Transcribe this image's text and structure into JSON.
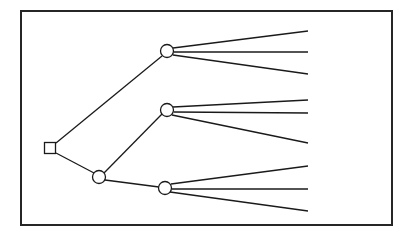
{
  "diagram": {
    "type": "decision-tree",
    "canvas": {
      "width": 412,
      "height": 238
    },
    "style": {
      "background_color": "#ffffff",
      "stroke_color": "#1a1a1a",
      "frame_stroke_color": "#262626",
      "node_fill_color": "#ffffff",
      "edge_stroke_width": 1.3,
      "frame_stroke_width": 2.0,
      "node_stroke_width": 1.3
    },
    "frame": {
      "x": 21,
      "y": 11,
      "width": 371,
      "height": 214
    },
    "nodes": [
      {
        "id": "root",
        "name": "root-decision-node",
        "shape": "square",
        "x": 50,
        "y": 148,
        "size": 11
      },
      {
        "id": "c-top",
        "name": "chance-node-top",
        "shape": "circle",
        "x": 167,
        "y": 51,
        "r": 6.5
      },
      {
        "id": "c-mid",
        "name": "chance-node-middle",
        "shape": "circle",
        "x": 167,
        "y": 110,
        "r": 6.5
      },
      {
        "id": "c-low",
        "name": "chance-node-lower-left",
        "shape": "circle",
        "x": 99,
        "y": 177,
        "r": 6.5
      },
      {
        "id": "c-bot",
        "name": "chance-node-bottom",
        "shape": "circle",
        "x": 165,
        "y": 188,
        "r": 6.5
      }
    ],
    "edges": [
      {
        "id": "e-root-top",
        "name": "edge-root-to-top-chance",
        "x1": 56,
        "y1": 143,
        "x2": 162,
        "y2": 56
      },
      {
        "id": "e-root-low",
        "name": "edge-root-to-lower-chance",
        "x1": 56,
        "y1": 153,
        "x2": 94,
        "y2": 173
      },
      {
        "id": "e-low-mid",
        "name": "edge-lower-to-middle-chance",
        "x1": 104,
        "y1": 173,
        "x2": 162,
        "y2": 114
      },
      {
        "id": "e-low-bot",
        "name": "edge-lower-to-bottom-chance",
        "x1": 105,
        "y1": 180,
        "x2": 159,
        "y2": 187
      }
    ],
    "terminal_branches": [
      {
        "id": "t1",
        "name": "terminal-branch-top-1",
        "from": "c-top",
        "x1": 173,
        "y1": 48,
        "x2": 308,
        "y2": 31
      },
      {
        "id": "t2",
        "name": "terminal-branch-top-2",
        "from": "c-top",
        "x1": 174,
        "y1": 52,
        "x2": 308,
        "y2": 52
      },
      {
        "id": "t3",
        "name": "terminal-branch-top-3",
        "from": "c-top",
        "x1": 173,
        "y1": 55,
        "x2": 308,
        "y2": 74
      },
      {
        "id": "t4",
        "name": "terminal-branch-middle-1",
        "from": "c-mid",
        "x1": 173,
        "y1": 107,
        "x2": 308,
        "y2": 100
      },
      {
        "id": "t5",
        "name": "terminal-branch-middle-2",
        "from": "c-mid",
        "x1": 174,
        "y1": 112,
        "x2": 308,
        "y2": 113
      },
      {
        "id": "t6",
        "name": "terminal-branch-middle-3",
        "from": "c-mid",
        "x1": 172,
        "y1": 115,
        "x2": 308,
        "y2": 143
      },
      {
        "id": "t7",
        "name": "terminal-branch-bottom-1",
        "from": "c-bot",
        "x1": 171,
        "y1": 184,
        "x2": 308,
        "y2": 166
      },
      {
        "id": "t8",
        "name": "terminal-branch-bottom-2",
        "from": "c-bot",
        "x1": 172,
        "y1": 189,
        "x2": 308,
        "y2": 189
      },
      {
        "id": "t9",
        "name": "terminal-branch-bottom-3",
        "from": "c-bot",
        "x1": 170,
        "y1": 192,
        "x2": 308,
        "y2": 211
      }
    ],
    "counts": {
      "decision_nodes": 1,
      "chance_nodes": 4,
      "terminal_branches": 9,
      "internal_edges": 4
    }
  }
}
